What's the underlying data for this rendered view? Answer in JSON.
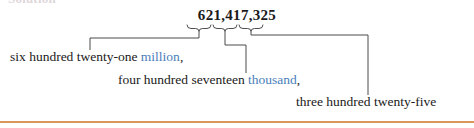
{
  "page": {
    "clipped_heading": "Solution",
    "accent_rule_color": "#d9975a",
    "unit_word_color": "#4a7ebb",
    "text_color": "#1a1a1a"
  },
  "number": {
    "value": "621,417,325",
    "groups": [
      {
        "digits": "621",
        "period": "million"
      },
      {
        "digits": "417",
        "period": "thousand"
      },
      {
        "digits": "325",
        "period": "ones"
      }
    ]
  },
  "expansion": [
    {
      "id": "millions",
      "words": "six hundred twenty-one",
      "unit": "million",
      "punctuation": ",",
      "full_text": "six hundred twenty-one million,"
    },
    {
      "id": "thousands",
      "words": "four hundred seventeen",
      "unit": "thousand",
      "punctuation": ",",
      "full_text": "four hundred seventeen thousand,"
    },
    {
      "id": "ones",
      "words": "three hundred twenty-five",
      "unit": "",
      "punctuation": "",
      "full_text": "three hundred twenty-five"
    }
  ]
}
